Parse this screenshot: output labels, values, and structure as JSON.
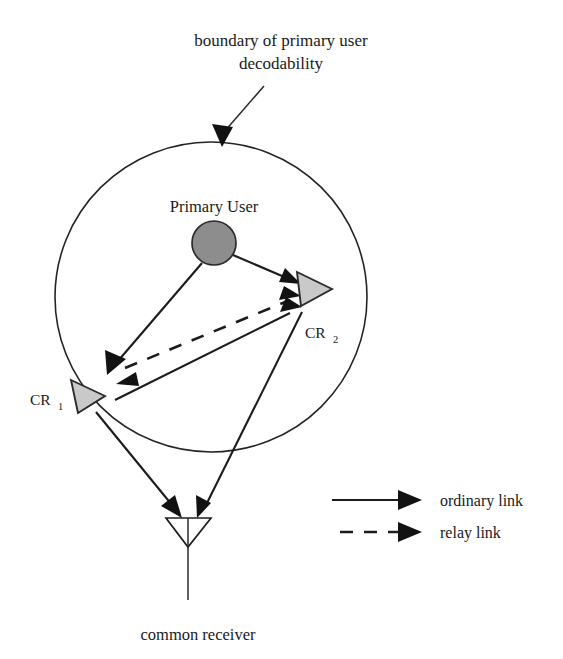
{
  "figure": {
    "title_line1": "boundary of primary user",
    "title_line2": "decodability",
    "caption": "common receiver"
  },
  "nodes": {
    "primary_user": {
      "label": "Primary User",
      "shape": "filled-circle",
      "color": "#8d8d8d"
    },
    "cr1": {
      "label": "CR",
      "subscript": "1",
      "shape": "triangle-right",
      "color": "#c9c9c9"
    },
    "cr2": {
      "label": "CR",
      "subscript": "2",
      "shape": "triangle-right",
      "color": "#c9c9c9"
    },
    "receiver": {
      "label": "common receiver",
      "shape": "antenna-triangle-down",
      "color": "#ffffff"
    }
  },
  "legend": {
    "items": [
      {
        "label": "ordinary link",
        "style": "solid"
      },
      {
        "label": "relay link",
        "style": "dashed"
      }
    ]
  },
  "links": [
    {
      "from": "primary_user",
      "to": "cr1",
      "style": "solid"
    },
    {
      "from": "primary_user",
      "to": "cr2",
      "style": "solid"
    },
    {
      "from": "cr1",
      "to": "cr2",
      "style": "dashed"
    },
    {
      "from": "cr2",
      "to": "cr1",
      "style": "dashed"
    },
    {
      "from": "cr1",
      "to": "cr2",
      "style": "solid"
    },
    {
      "from": "cr1",
      "to": "receiver",
      "style": "solid"
    },
    {
      "from": "cr2",
      "to": "receiver",
      "style": "solid"
    }
  ],
  "boundary": {
    "label": "boundary of primary user decodability",
    "shape": "circle"
  }
}
